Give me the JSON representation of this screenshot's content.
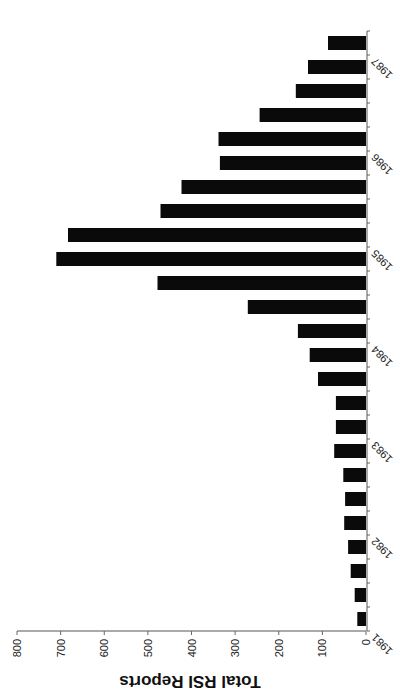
{
  "chart_data": {
    "type": "bar",
    "orientation_note": "image rotated 90deg clockwise; value axis along bottom (reversed), category axis along right",
    "title": "",
    "xlabel": "",
    "ylabel": "Total RSI Reports",
    "ylim": [
      0,
      800
    ],
    "yticks": [
      0,
      100,
      200,
      300,
      400,
      500,
      600,
      700,
      800
    ],
    "year_labels": [
      "1981",
      "1982",
      "1983",
      "1984",
      "1985",
      "1986",
      "1987"
    ],
    "grid": false,
    "legend": null,
    "categories": [
      "1981 Q1",
      "1981 Q2",
      "1981 Q3",
      "1981 Q4",
      "1982 Q1",
      "1982 Q2",
      "1982 Q3",
      "1982 Q4",
      "1983 Q1",
      "1983 Q2",
      "1983 Q3",
      "1983 Q4",
      "1984 Q1",
      "1984 Q2",
      "1984 Q3",
      "1984 Q4",
      "1985 Q1",
      "1985 Q2",
      "1985 Q3",
      "1985 Q4",
      "1986 Q1",
      "1986 Q2",
      "1986 Q3",
      "1986 Q4",
      "1987 Q1"
    ],
    "values": [
      20,
      26,
      35,
      41,
      50,
      48,
      52,
      73,
      69,
      69,
      110,
      129,
      156,
      271,
      478,
      710,
      683,
      471,
      423,
      335,
      338,
      244,
      161,
      133,
      87
    ],
    "bar_color": "#0a0a0a"
  }
}
